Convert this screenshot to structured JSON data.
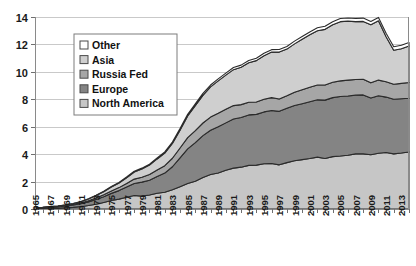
{
  "chart_data": {
    "type": "area",
    "stacked": true,
    "title": "",
    "subtitle": "",
    "xlabel": "",
    "ylabel": "",
    "ylim": [
      0,
      14
    ],
    "ytick_step": 2,
    "yticks": [
      "0",
      "2",
      "4",
      "6",
      "8",
      "10",
      "12",
      "14"
    ],
    "grid": true,
    "legend_position": "upper-left-inside",
    "x": [
      1965,
      1966,
      1967,
      1968,
      1969,
      1970,
      1971,
      1972,
      1973,
      1974,
      1975,
      1976,
      1977,
      1978,
      1979,
      1980,
      1981,
      1982,
      1983,
      1984,
      1985,
      1986,
      1987,
      1988,
      1989,
      1990,
      1991,
      1992,
      1993,
      1994,
      1995,
      1996,
      1997,
      1998,
      1999,
      2000,
      2001,
      2002,
      2003,
      2004,
      2005,
      2006,
      2007,
      2008,
      2009,
      2010,
      2011,
      2012,
      2013,
      2014
    ],
    "xtick_labels": [
      "1965",
      "1967",
      "1969",
      "1971",
      "1973",
      "1975",
      "1977",
      "1979",
      "1981",
      "1983",
      "1985",
      "1987",
      "1989",
      "1991",
      "1993",
      "1995",
      "1997",
      "1999",
      "2001",
      "2003",
      "2005",
      "2007",
      "2009",
      "2011",
      "2013"
    ],
    "xtick_step": 2,
    "series": [
      {
        "name": "North America",
        "color": "#c6c6c6",
        "values": [
          0.03,
          0.04,
          0.05,
          0.07,
          0.09,
          0.12,
          0.17,
          0.25,
          0.35,
          0.48,
          0.62,
          0.72,
          0.86,
          0.98,
          0.94,
          1.02,
          1.15,
          1.22,
          1.4,
          1.63,
          1.86,
          2.02,
          2.3,
          2.52,
          2.62,
          2.82,
          2.98,
          3.05,
          3.18,
          3.2,
          3.3,
          3.32,
          3.22,
          3.38,
          3.52,
          3.6,
          3.68,
          3.78,
          3.68,
          3.82,
          3.86,
          3.92,
          4.02,
          4.02,
          3.96,
          4.06,
          4.12,
          4.02,
          4.08,
          4.16
        ]
      },
      {
        "name": "Europe",
        "color": "#848484",
        "values": [
          0.05,
          0.06,
          0.08,
          0.1,
          0.13,
          0.17,
          0.21,
          0.27,
          0.34,
          0.42,
          0.52,
          0.62,
          0.74,
          0.88,
          1.02,
          1.08,
          1.22,
          1.4,
          1.68,
          2.1,
          2.52,
          2.82,
          3.05,
          3.22,
          3.38,
          3.46,
          3.58,
          3.62,
          3.68,
          3.7,
          3.78,
          3.86,
          3.9,
          3.96,
          4.02,
          4.08,
          4.14,
          4.18,
          4.26,
          4.3,
          4.34,
          4.32,
          4.28,
          4.3,
          4.14,
          4.2,
          4.04,
          3.98,
          3.96,
          3.92
        ]
      },
      {
        "name": "Russia Fed",
        "color": "#a6a6a6",
        "values": [
          0.01,
          0.01,
          0.02,
          0.02,
          0.03,
          0.04,
          0.06,
          0.08,
          0.11,
          0.14,
          0.18,
          0.22,
          0.26,
          0.32,
          0.36,
          0.42,
          0.48,
          0.54,
          0.62,
          0.72,
          0.82,
          0.88,
          0.92,
          0.96,
          0.98,
          1.0,
          0.98,
          0.94,
          0.92,
          0.9,
          0.92,
          0.94,
          0.9,
          0.92,
          0.98,
          1.02,
          1.06,
          1.08,
          1.1,
          1.12,
          1.14,
          1.16,
          1.14,
          1.14,
          1.1,
          1.14,
          1.12,
          1.1,
          1.12,
          1.14
        ]
      },
      {
        "name": "Asia",
        "color": "#cfcfcf",
        "values": [
          0.01,
          0.01,
          0.02,
          0.03,
          0.04,
          0.06,
          0.09,
          0.13,
          0.18,
          0.22,
          0.28,
          0.34,
          0.42,
          0.52,
          0.6,
          0.68,
          0.8,
          0.92,
          1.08,
          1.3,
          1.58,
          1.82,
          2.02,
          2.2,
          2.36,
          2.48,
          2.62,
          2.72,
          2.88,
          3.02,
          3.18,
          3.32,
          3.42,
          3.4,
          3.52,
          3.68,
          3.82,
          3.96,
          4.06,
          4.2,
          4.32,
          4.3,
          4.22,
          4.22,
          4.24,
          4.32,
          3.28,
          2.48,
          2.52,
          2.66
        ]
      },
      {
        "name": "Other",
        "color": "#ffffff",
        "values": [
          0.0,
          0.0,
          0.0,
          0.0,
          0.01,
          0.01,
          0.01,
          0.02,
          0.02,
          0.03,
          0.04,
          0.04,
          0.05,
          0.06,
          0.06,
          0.07,
          0.08,
          0.09,
          0.1,
          0.11,
          0.12,
          0.13,
          0.14,
          0.14,
          0.15,
          0.15,
          0.16,
          0.16,
          0.17,
          0.17,
          0.18,
          0.18,
          0.19,
          0.19,
          0.2,
          0.2,
          0.21,
          0.21,
          0.22,
          0.22,
          0.23,
          0.23,
          0.24,
          0.24,
          0.24,
          0.25,
          0.25,
          0.25,
          0.26,
          0.26
        ]
      }
    ]
  },
  "legend": {
    "entries": [
      {
        "label": "Other",
        "color": "#ffffff"
      },
      {
        "label": "Asia",
        "color": "#cfcfcf"
      },
      {
        "label": "Russia Fed",
        "color": "#a6a6a6"
      },
      {
        "label": "Europe",
        "color": "#848484"
      },
      {
        "label": "North America",
        "color": "#c6c6c6"
      }
    ]
  },
  "colors": {
    "plot_background": "#ffffff",
    "gridline": "#c9c9c9",
    "axis": "#8a8a8a",
    "series_outline": "#2b2b2b",
    "text": "#1a1a1a"
  }
}
